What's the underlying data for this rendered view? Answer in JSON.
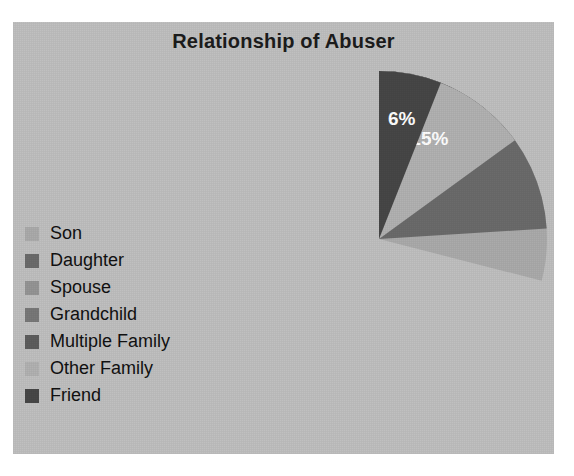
{
  "panel": {
    "background_color": "#c0c0c0",
    "page_background_color": "#ffffff"
  },
  "chart_data": {
    "type": "pie",
    "title": "Relationship of Abuser",
    "xlabel": "",
    "ylabel": "",
    "legend_position": "left",
    "grid": false,
    "start_angle_deg": 0,
    "direction": "clockwise",
    "categories": [
      "Son",
      "Daughter",
      "Spouse",
      "Grandchild",
      "Multiple Family",
      "Other Family",
      "Friend"
    ],
    "values": [
      29,
      24,
      8,
      7,
      11,
      15,
      6
    ],
    "value_labels": [
      "29%",
      "24%",
      "8%",
      "7%",
      "11%",
      "15%",
      "6%"
    ],
    "colors": [
      "#ababab",
      "#6b6b6b",
      "#959595",
      "#787878",
      "#5e5e5e",
      "#b2b2b2",
      "#474747"
    ],
    "label_color": "#ffffff",
    "slices": [
      {
        "label": "Son",
        "value": 29,
        "display": "29%",
        "color": "#ababab"
      },
      {
        "label": "Daughter",
        "value": 24,
        "display": "24%",
        "color": "#6b6b6b"
      },
      {
        "label": "Spouse",
        "value": 8,
        "display": "8%",
        "color": "#959595"
      },
      {
        "label": "Grandchild",
        "value": 7,
        "display": "7%",
        "color": "#787878"
      },
      {
        "label": "Multiple Family",
        "value": 11,
        "display": "11%",
        "color": "#5e5e5e"
      },
      {
        "label": "Other Family",
        "value": 15,
        "display": "15%",
        "color": "#b2b2b2"
      },
      {
        "label": "Friend",
        "value": 6,
        "display": "6%",
        "color": "#474747"
      }
    ]
  },
  "legend": {
    "items": [
      {
        "label": "Son",
        "color": "#ababab"
      },
      {
        "label": "Daughter",
        "color": "#6b6b6b"
      },
      {
        "label": "Spouse",
        "color": "#959595"
      },
      {
        "label": "Grandchild",
        "color": "#787878"
      },
      {
        "label": "Multiple Family",
        "color": "#5e5e5e"
      },
      {
        "label": "Other Family",
        "color": "#b2b2b2"
      },
      {
        "label": "Friend",
        "color": "#474747"
      }
    ]
  }
}
